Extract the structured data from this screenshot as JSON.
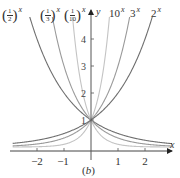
{
  "chart_data": {
    "type": "line",
    "title": "",
    "caption": "(b)",
    "xlabel": "x",
    "ylabel": "y",
    "xlim": [
      -2.9,
      3.0
    ],
    "ylim": [
      0,
      4.9
    ],
    "xticks": [
      -2,
      -1,
      1,
      2
    ],
    "xtick_labels": [
      "−2",
      "−1",
      "1",
      "2"
    ],
    "yticks": [
      1,
      2,
      3,
      4
    ],
    "ytick_labels": [
      "1",
      "2",
      "3",
      "4"
    ],
    "grid": false,
    "legend": "inline labels at top",
    "series": [
      {
        "name": "(1/2)^x",
        "base": 0.5,
        "color": "#6f6f6f",
        "label_num": "1",
        "label_den": "2"
      },
      {
        "name": "(1/3)^x",
        "base": 0.3333,
        "color": "#9a9a9a",
        "label_num": "1",
        "label_den": "3"
      },
      {
        "name": "(1/10)^x",
        "base": 0.1,
        "color": "#c4c4c4",
        "label_num": "1",
        "label_den": "10"
      },
      {
        "name": "10^x",
        "base": 10,
        "color": "#c4c4c4",
        "label_base": "10"
      },
      {
        "name": "3^x",
        "base": 3,
        "color": "#9a9a9a",
        "label_base": "3"
      },
      {
        "name": "2^x",
        "base": 2,
        "color": "#6f6f6f",
        "label_base": "2"
      }
    ]
  },
  "layout": {
    "origin_px": [
      91,
      147
    ],
    "unit_px": 27,
    "plot_top_px": 17,
    "plot_left_px": 12,
    "plot_right_px": 170,
    "x_axis_y_px": 151
  },
  "labels": {
    "x_axis": "x",
    "y_axis": "y",
    "caption_open": "(",
    "caption_letter": "b",
    "caption_close": ")",
    "exponent": "x"
  }
}
